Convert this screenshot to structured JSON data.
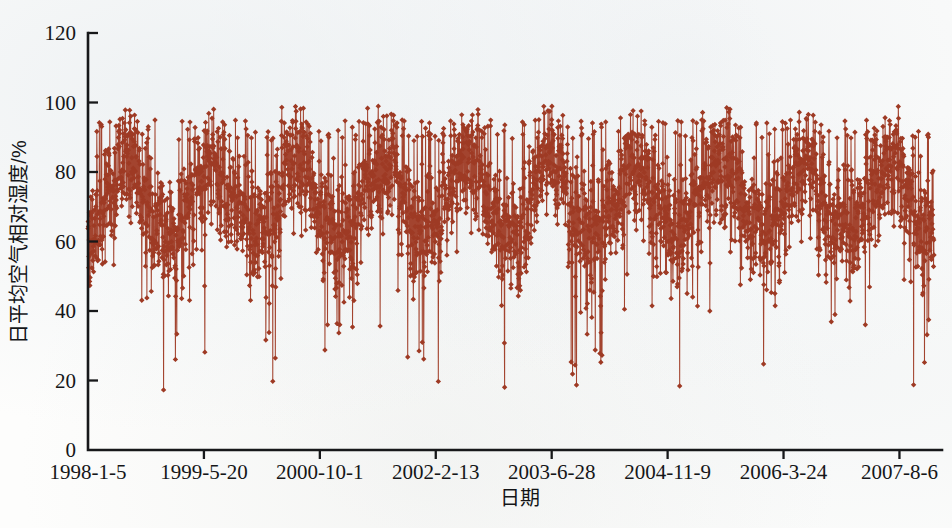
{
  "figure": {
    "background_color": "#fdfdfc",
    "axis_color": "#17181a",
    "series_color": "#9E3A24"
  },
  "chart_data": {
    "type": "line",
    "title": "",
    "subtitle": "",
    "xlabel": "日期",
    "ylabel": "日平均空气相对湿度/%",
    "grid": false,
    "legend": "none",
    "marker": "diamond",
    "line_style": "solid",
    "series_name": "日平均空气相对湿度",
    "series_color": "#9E3A24",
    "ylim": [
      0,
      120
    ],
    "yticks": [
      0,
      20,
      40,
      60,
      80,
      100,
      120
    ],
    "ytick_labels": [
      "0",
      "20",
      "40",
      "60",
      "80",
      "100",
      "120"
    ],
    "xtick_labels": [
      "1998-1-5",
      "1999-5-20",
      "2000-10-1",
      "2002-2-13",
      "2003-6-28",
      "2004-11-9",
      "2006-3-24",
      "2007-8-6"
    ],
    "xtick_index": [
      0,
      500,
      1000,
      1500,
      2000,
      2500,
      3000,
      3500
    ],
    "x_range_days": [
      0,
      3650
    ],
    "x_start_date": "1998-1-5",
    "x_end_date": "2007-12-31",
    "sampling": "daily",
    "n_points": 3650,
    "value_units": "%",
    "observed_min": 17,
    "observed_max": 99,
    "typical_band": [
      45,
      95
    ],
    "annual_cycle_note": "seasonal: humid summer peaks near 95-99%, dry winter/spring troughs reaching 17-30%",
    "seasonal_mean": 72,
    "seasonal_amplitude": 10,
    "daily_noise_sd": 14
  }
}
